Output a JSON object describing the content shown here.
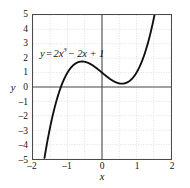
{
  "chart_data": {
    "type": "line",
    "title": "",
    "xlabel": "x",
    "ylabel": "y",
    "equation_label": "y = 2x³ − 2x + 1",
    "equation_parts": {
      "lhs": "y",
      "equals": "=",
      "term1_coef": "2x",
      "term1_exp": "3",
      "term2": "− 2x + 1"
    },
    "xlim": [
      -2,
      2
    ],
    "ylim": [
      -5,
      5
    ],
    "grid": true,
    "grid_step_x": 0.5,
    "grid_step_y": 1,
    "legend": "none",
    "curve_color": "#111111",
    "axis_color": "#4a4a4a",
    "grid_color": "#c8c8c8",
    "background": "#ffffff",
    "xticks": [
      -2,
      -1,
      0,
      1,
      2
    ],
    "xtick_labels": [
      "–2",
      "–1",
      "0",
      "1",
      "2"
    ],
    "yticks": [
      5,
      4,
      3,
      2,
      1,
      0,
      -1,
      -2,
      -3,
      -4,
      -5
    ],
    "ytick_labels": [
      "5",
      "4",
      "3",
      "2",
      "1",
      "0",
      "–1",
      "–2",
      "–3",
      "–4",
      "–5"
    ],
    "series": [
      {
        "name": "y = 2x³ − 2x + 1",
        "x": [
          -1.6,
          -1.55,
          -1.5,
          -1.45,
          -1.4,
          -1.35,
          -1.3,
          -1.25,
          -1.2,
          -1.15,
          -1.1,
          -1.05,
          -1.0,
          -0.95,
          -0.9,
          -0.85,
          -0.8,
          -0.75,
          -0.7,
          -0.65,
          -0.6,
          -0.55,
          -0.5,
          -0.45,
          -0.4,
          -0.35,
          -0.3,
          -0.25,
          -0.2,
          -0.15,
          -0.1,
          -0.05,
          0.0,
          0.05,
          0.1,
          0.15,
          0.2,
          0.25,
          0.3,
          0.35,
          0.4,
          0.45,
          0.5,
          0.55,
          0.6,
          0.65,
          0.7,
          0.75,
          0.8,
          0.85,
          0.9,
          0.95,
          1.0,
          1.05,
          1.1,
          1.15,
          1.2,
          1.25,
          1.3,
          1.35,
          1.4,
          1.45,
          1.5
        ],
        "y": [
          -4.99,
          -4.35,
          -3.75,
          -3.2,
          -2.68,
          -2.22,
          -1.79,
          -1.41,
          -1.06,
          -0.74,
          -0.46,
          -0.22,
          1.0,
          0.19,
          0.34,
          0.47,
          0.576,
          0.656,
          0.714,
          0.751,
          0.768,
          0.767,
          0.75,
          0.718,
          0.672,
          0.614,
          0.546,
          0.469,
          0.384,
          0.293,
          0.198,
          0.0997,
          1.0,
          0.9,
          0.802,
          0.707,
          0.616,
          0.531,
          0.454,
          0.386,
          0.328,
          0.282,
          0.25,
          0.233,
          0.232,
          0.249,
          0.286,
          0.344,
          0.424,
          0.528,
          0.658,
          0.815,
          1.0,
          1.215,
          1.462,
          1.741,
          2.056,
          2.406,
          2.794,
          3.221,
          3.688,
          4.198,
          4.75
        ]
      }
    ]
  },
  "axes": {
    "y_title": "y",
    "x_title": "x"
  }
}
